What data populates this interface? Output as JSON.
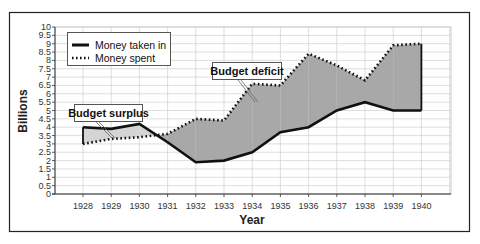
{
  "chart_data": {
    "type": "line",
    "title": "",
    "xlabel": "Year",
    "ylabel": "Billions",
    "ylim": [
      0,
      10
    ],
    "y_ticks": [
      "0",
      "0.5",
      "1",
      "1.5",
      "2",
      "2.5",
      "3",
      "3.5",
      "4",
      "4.5",
      "5",
      "5.5",
      "6",
      "6.5",
      "7",
      "7.5",
      "8",
      "8.5",
      "9",
      "9.5",
      "10"
    ],
    "categories": [
      "1928",
      "1929",
      "1930",
      "1931",
      "1932",
      "1933",
      "1934",
      "1935",
      "1936",
      "1937",
      "1938",
      "1939",
      "1940"
    ],
    "series": [
      {
        "name": "Money taken in",
        "style": "solid",
        "values": [
          4.0,
          3.9,
          4.2,
          3.1,
          1.9,
          2.0,
          2.5,
          3.7,
          4.0,
          5.0,
          5.5,
          5.0,
          5.0
        ]
      },
      {
        "name": "Money spent",
        "style": "dotted",
        "values": [
          3.0,
          3.3,
          3.4,
          3.6,
          4.5,
          4.4,
          6.6,
          6.5,
          8.4,
          7.7,
          6.8,
          8.9,
          9.0
        ]
      }
    ],
    "fill_between": {
      "surplus_color": "#d4d4d4",
      "deficit_color": "#a8a8a8"
    },
    "grid": true,
    "legend_position": "upper left",
    "annotations": [
      "Budget surplus",
      "Budget deficit"
    ]
  },
  "legend": {
    "items": [
      {
        "label": "Money taken in"
      },
      {
        "label": "Money spent"
      }
    ]
  },
  "callouts": {
    "surplus": "Budget surplus",
    "deficit": "Budget deficit"
  },
  "axes": {
    "x_title": "Year",
    "y_title": "Billions"
  },
  "colors": {
    "line": "#111111",
    "grid": "#d0d0d0",
    "surplus_fill": "#d4d4d4",
    "deficit_fill": "#a8a8a8",
    "frame": "#222222"
  }
}
